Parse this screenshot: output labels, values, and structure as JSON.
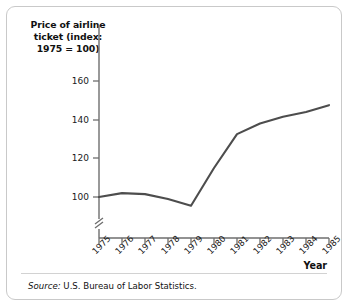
{
  "figure": {
    "y_axis_title": "Price of airline ticket (index: 1975 = 100)",
    "x_axis_title": "Year",
    "source_keyword": "Source:",
    "source_text": " U.S. Bureau of Labor Statistics.",
    "border_color": "#c9c9c9",
    "line_color": "#4d4d4d",
    "axis_color": "#6e6e6e",
    "background": "#ffffff"
  },
  "chart_data": {
    "type": "line",
    "title": "",
    "xlabel": "Year",
    "ylabel": "Price of airline ticket (index: 1975 = 100)",
    "categories": [
      "1975",
      "1976",
      "1977",
      "1978",
      "1979",
      "1980",
      "1981",
      "1982",
      "1983",
      "1984",
      "1985"
    ],
    "x": [
      1975,
      1976,
      1977,
      1978,
      1979,
      1980,
      1981,
      1982,
      1983,
      1984,
      1985
    ],
    "values": [
      100,
      102,
      101.5,
      99,
      95.5,
      115,
      132.5,
      138,
      141.5,
      144,
      147.5
    ],
    "series": [
      {
        "name": "Price of airline ticket (index: 1975 = 100)",
        "values": [
          100,
          102,
          101.5,
          99,
          95.5,
          115,
          132.5,
          138,
          141.5,
          144,
          147.5
        ]
      }
    ],
    "ylim": [
      88,
      168
    ],
    "xlim": [
      1975,
      1985
    ],
    "yticks": [
      100,
      120,
      140,
      160
    ],
    "ytick_labels": [
      "100",
      "120",
      "140",
      "160"
    ],
    "xtick_labels": [
      "1975",
      "1976",
      "1977",
      "1978",
      "1979",
      "1980",
      "1981",
      "1982",
      "1983",
      "1984",
      "1985"
    ],
    "grid": false,
    "legend": "none",
    "axis_break": "y-axis break below 100",
    "annotations": []
  }
}
